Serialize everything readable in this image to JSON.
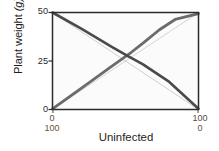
{
  "chart_data": {
    "type": "line",
    "title": "",
    "xlabel": "Uninfected",
    "ylabel": "Plant weight (g)",
    "ylabel_parts": {
      "text": "Plant weight ",
      "unit": "(g)"
    },
    "xlim": [
      0,
      100
    ],
    "ylim": [
      0,
      50
    ],
    "grid": false,
    "legend_position": "none",
    "y_ticks": [
      {
        "value": 50,
        "label": "50"
      },
      {
        "value": 25,
        "label": "25"
      },
      {
        "value": 0,
        "label": "0"
      }
    ],
    "x_axes": [
      {
        "name": "uninfected",
        "ticks": [
          {
            "value": 0,
            "label": "0"
          },
          {
            "value": 100,
            "label": "100"
          }
        ],
        "color": "#52504c"
      },
      {
        "name": "infected",
        "ticks": [
          {
            "value": 0,
            "label": "100"
          },
          {
            "value": 100,
            "label": "0"
          }
        ],
        "color": "#6d5336"
      }
    ],
    "series": [
      {
        "name": "uninfected-observed",
        "style": "thick-dark-descending",
        "color": "#4a4a4a",
        "width": 2.6,
        "x": [
          0,
          20,
          40,
          52,
          62,
          80,
          100
        ],
        "y": [
          50,
          41.5,
          32.6,
          27.4,
          23.3,
          14.2,
          0.4
        ]
      },
      {
        "name": "infected-observed",
        "style": "thick-dark-ascending-kinked",
        "color": "#6b6b6b",
        "width": 2.8,
        "x": [
          0,
          22,
          40,
          54,
          62,
          73,
          84,
          100
        ],
        "y": [
          0.3,
          12.2,
          22.0,
          29.5,
          34.2,
          41.0,
          46.4,
          49.4
        ]
      },
      {
        "name": "expected-uninfected",
        "style": "thin-light-descending",
        "color": "#c9c9c9",
        "width": 0.9,
        "x": [
          0,
          100
        ],
        "y": [
          50,
          0
        ]
      },
      {
        "name": "expected-infected",
        "style": "thin-light-ascending",
        "color": "#cfcfcf",
        "width": 0.9,
        "x": [
          0,
          100
        ],
        "y": [
          0,
          50
        ]
      }
    ],
    "colors": {
      "plot_background": "#fbfbfb",
      "frame": "#2b2b2b",
      "tick_label": "#2a2a2a",
      "second_axis_label": "#6d5336"
    }
  }
}
